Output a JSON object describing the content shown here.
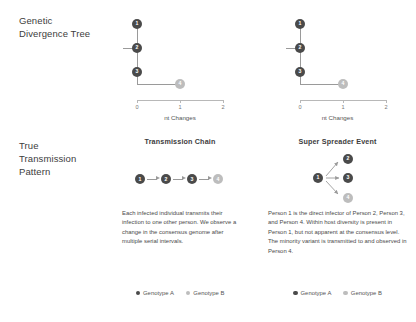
{
  "rows": {
    "genetic_divergence_label": "Genetic\nDivergence Tree",
    "true_transmission_label": "True\nTransmission\nPattern"
  },
  "colors": {
    "genotype_a": "#4a4a4a",
    "genotype_b": "#bdbdbd",
    "line": "#9a9a9a",
    "axis": "#b8b8b8",
    "text": "#3d3d3d"
  },
  "panels": {
    "chain": {
      "title": "Transmission Chain",
      "caption": "Each infected individual transmits their infection to one other person. We observe a change in the consensus genome after multiple serial intervals.",
      "tree": {
        "axis_title": "nt Changes",
        "tick_labels": [
          "0",
          "1",
          "2"
        ],
        "axis_min": 0,
        "axis_max": 2,
        "nodes": [
          {
            "label": "1",
            "genotype": "A",
            "nt": 0
          },
          {
            "label": "2",
            "genotype": "A",
            "nt": 0
          },
          {
            "label": "3",
            "genotype": "A",
            "nt": 0
          },
          {
            "label": "4",
            "genotype": "B",
            "nt": 1
          }
        ]
      },
      "chain_nodes": [
        {
          "label": "1",
          "genotype": "A"
        },
        {
          "label": "2",
          "genotype": "A"
        },
        {
          "label": "3",
          "genotype": "A"
        },
        {
          "label": "4",
          "genotype": "B"
        }
      ],
      "legend": [
        {
          "label": "Genotype A",
          "genotype": "A"
        },
        {
          "label": "Genotype B",
          "genotype": "B"
        }
      ]
    },
    "spreader": {
      "title": "Super Spreader Event",
      "caption": "Person 1 is the direct infector of Person 2, Person 3, and Person 4. Within host diversity is present in Person 1, but not apparent at the consensus level. The minority variant is  transmitted to and observed in Person 4.",
      "tree": {
        "axis_title": "nt Changes",
        "tick_labels": [
          "0",
          "1",
          "2"
        ],
        "axis_min": 0,
        "axis_max": 2,
        "nodes": [
          {
            "label": "1",
            "genotype": "A",
            "nt": 0
          },
          {
            "label": "2",
            "genotype": "A",
            "nt": 0
          },
          {
            "label": "3",
            "genotype": "A",
            "nt": 0
          },
          {
            "label": "4",
            "genotype": "B",
            "nt": 1
          }
        ]
      },
      "spreader_nodes": [
        {
          "label": "1",
          "genotype": "A"
        },
        {
          "label": "2",
          "genotype": "A"
        },
        {
          "label": "3",
          "genotype": "A"
        },
        {
          "label": "4",
          "genotype": "B"
        }
      ],
      "legend": [
        {
          "label": "Genotype A",
          "genotype": "A"
        },
        {
          "label": "Genotype B",
          "genotype": "B"
        }
      ]
    }
  },
  "chart_data": {
    "type": "diagram",
    "panels": [
      {
        "name": "Transmission Chain",
        "tree": {
          "xlabel": "nt Changes",
          "xlim": [
            0,
            2
          ],
          "ticks": [
            0,
            1,
            2
          ],
          "tips": [
            {
              "id": "1",
              "x": 0,
              "y": 3,
              "genotype": "A"
            },
            {
              "id": "2",
              "x": 0,
              "y": 2,
              "genotype": "A"
            },
            {
              "id": "3",
              "x": 0,
              "y": 1,
              "genotype": "A"
            },
            {
              "id": "4",
              "x": 1,
              "y": 0,
              "genotype": "B"
            }
          ]
        },
        "transmission": {
          "type": "chain",
          "edges": [
            [
              "1",
              "2"
            ],
            [
              "2",
              "3"
            ],
            [
              "3",
              "4"
            ]
          ]
        }
      },
      {
        "name": "Super Spreader Event",
        "tree": {
          "xlabel": "nt Changes",
          "xlim": [
            0,
            2
          ],
          "ticks": [
            0,
            1,
            2
          ],
          "tips": [
            {
              "id": "1",
              "x": 0,
              "y": 3,
              "genotype": "A"
            },
            {
              "id": "2",
              "x": 0,
              "y": 2,
              "genotype": "A"
            },
            {
              "id": "3",
              "x": 0,
              "y": 1,
              "genotype": "A"
            },
            {
              "id": "4",
              "x": 1,
              "y": 0,
              "genotype": "B"
            }
          ]
        },
        "transmission": {
          "type": "star",
          "edges": [
            [
              "1",
              "2"
            ],
            [
              "1",
              "3"
            ],
            [
              "1",
              "4"
            ]
          ]
        }
      }
    ]
  }
}
